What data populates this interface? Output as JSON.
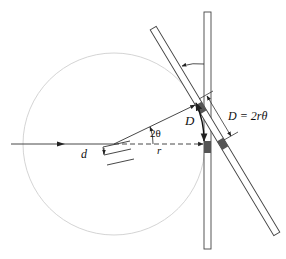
{
  "diagram": {
    "labels": {
      "d": "d",
      "two_theta": "2θ",
      "r": "r",
      "D": "D",
      "formula": "D = 2rθ"
    },
    "elements": [
      "incident-beam",
      "diffraction-circle",
      "crystal-planes",
      "diffracted-beam",
      "direct-beam-dashed",
      "vertical-detector",
      "tilted-detector",
      "arc-D",
      "rotation-arrow"
    ],
    "colors": {
      "line": "#222222",
      "circle": "#c8c8c8",
      "spot": "#555555",
      "bar_fill": "#ffffff"
    }
  }
}
